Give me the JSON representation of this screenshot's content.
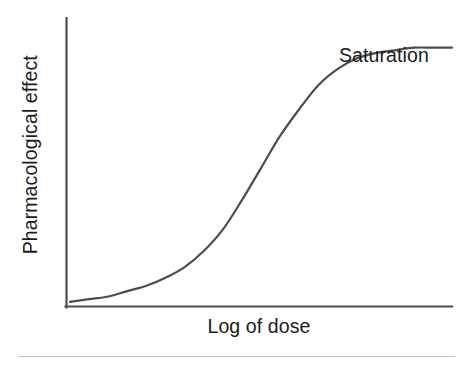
{
  "figure": {
    "name": "dose-response-curve",
    "background_color": "#ffffff",
    "axis_color": "#4d4d4d",
    "curve_color": "#4d4d4d",
    "text_color": "#1c1c1c",
    "rule_color": "#c3c3c3"
  },
  "labels": {
    "y_axis": "Pharmacological effect",
    "x_axis": "Log of dose",
    "saturation": "Saturation"
  },
  "chart_data": {
    "type": "line",
    "title": "",
    "subtitle": "",
    "xlabel": "Log of dose",
    "ylabel": "Pharmacological effect",
    "xlim": [
      0,
      100
    ],
    "ylim": [
      0,
      100
    ],
    "grid": false,
    "legend": null,
    "axis_ticks": {
      "x": [],
      "y": []
    },
    "annotations": [
      {
        "text": "Saturation",
        "x": 71,
        "y": 88,
        "note": "points at the flat plateau of the sigmoid curve"
      }
    ],
    "series": [
      {
        "name": "Dose-response (sigmoid)",
        "color": "#4d4d4d",
        "line_width": 2,
        "x": [
          0,
          5,
          10,
          15,
          20,
          25,
          30,
          35,
          40,
          45,
          50,
          55,
          60,
          65,
          70,
          75,
          80,
          85,
          90,
          95,
          100
        ],
        "y": [
          1,
          2,
          3,
          5,
          7,
          10,
          14,
          20,
          28,
          39,
          51,
          63,
          73,
          82,
          88,
          92,
          94,
          95,
          96,
          96,
          96
        ]
      }
    ]
  }
}
